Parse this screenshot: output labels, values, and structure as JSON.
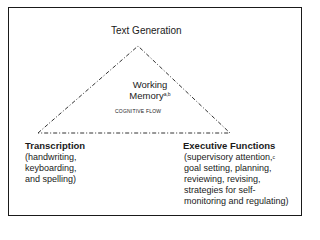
{
  "diagram": {
    "apex": {
      "label": "Text Generation"
    },
    "center": {
      "label_line1": "Working",
      "label_line2": "Memory",
      "label_superscript": "a,b",
      "flow_label": "COGNITIVE FLOW"
    },
    "left_vertex": {
      "title": "Transcription",
      "details": [
        "(handwriting,",
        "keyboarding,",
        "and spelling)"
      ]
    },
    "right_vertex": {
      "title": "Executive Functions",
      "details_first": "(supervisory attention,",
      "details_first_superscript": "c",
      "details": [
        "goal setting, planning,",
        "reviewing, revising,",
        "strategies for self-",
        "monitoring and regulating)"
      ]
    },
    "shape": {
      "type": "triangle",
      "line_style": "dash-dot",
      "color": "#333333"
    }
  }
}
